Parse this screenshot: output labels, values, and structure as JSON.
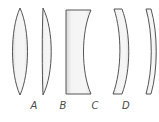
{
  "figure": {
    "background_color": "#ffffff",
    "stroke_color": "#555555",
    "fill_color": "#f2f2f2",
    "fill_color_edge": "#dcdcdc",
    "label_color": "#4a4a4a",
    "lens_count_visible": 5
  },
  "lenses": [
    {
      "id": "A",
      "label": "A",
      "shape_name": "biconvex-lens",
      "description": "biconvex (double convex)",
      "label_x": 34,
      "label_y": 100,
      "path": "M 20 8 C 30 30, 30 73, 20 95 C 10 73, 10 30, 20 8 Z"
    },
    {
      "id": "B",
      "label": "B",
      "shape_name": "plano-convex-lens",
      "description": "plano-convex, flat left face",
      "label_x": 63,
      "label_y": 100,
      "path": "M 43 8 C 54 30, 54 73, 43 95 C 42 73, 42 30, 43 8 Z"
    },
    {
      "id": "C",
      "label": "C",
      "shape_name": "plano-concave-lens",
      "description": "plano-concave, flat left face, concave right face",
      "label_x": 95,
      "label_y": 100,
      "path": "M 66 10 L 91 10 C 81 32, 81 72, 91 94 L 66 94 Z"
    },
    {
      "id": "D",
      "label": "D",
      "shape_name": "meniscus-lens",
      "description": "meniscus crescent, concave left face, convex right face",
      "label_x": 126,
      "label_y": 100,
      "path": "M 114 9 L 122 9 C 131 33, 131 70, 122 94 L 113 94 C 122 70, 122 33, 114 9 Z"
    },
    {
      "id": "E",
      "label": "",
      "shape_name": "meniscus-lens-cropped",
      "description": "thin meniscus crescent, cropped by right edge",
      "label_x": 0,
      "label_y": 0,
      "path": "M 146 9 L 151 9 C 158 33, 158 70, 151 94 L 146 94 C 153 70, 153 33, 146 9 Z"
    }
  ],
  "labels": {
    "a": "A",
    "b": "B",
    "c": "C",
    "d": "D"
  }
}
